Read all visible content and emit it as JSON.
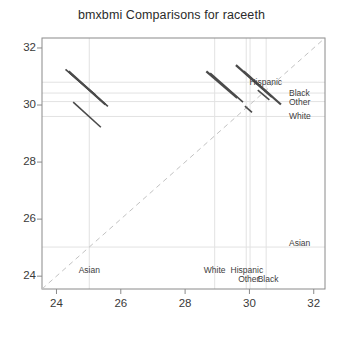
{
  "chart_data": {
    "type": "scatter",
    "title": "bmxbmi Comparisons for raceeth",
    "xlabel": "",
    "ylabel": "",
    "xlim": [
      23.55,
      32.35
    ],
    "ylim": [
      23.55,
      32.35
    ],
    "xticks": [
      "24",
      "26",
      "28",
      "30",
      "32"
    ],
    "xtick_values": [
      24,
      26,
      28,
      30,
      32
    ],
    "yticks": [
      "24",
      "26",
      "28",
      "30",
      "32"
    ],
    "ytick_values": [
      24,
      26,
      28,
      30,
      32
    ],
    "grid": true,
    "legend": "none",
    "reference_line": {
      "name": "identity-line",
      "style": "dashed",
      "color": "#c2c2c2",
      "from": [
        23.55,
        23.55
      ],
      "to": [
        32.35,
        32.35
      ]
    },
    "groups": [
      {
        "name": "Asian",
        "x": 25.02,
        "y": 25.02
      },
      {
        "name": "White",
        "x": 28.92,
        "y": 29.6
      },
      {
        "name": "Hispanic",
        "x": 29.9,
        "y": 30.8
      },
      {
        "name": "Other",
        "x": 30.02,
        "y": 30.12
      },
      {
        "name": "Black",
        "x": 30.52,
        "y": 30.42
      }
    ],
    "comparison_segments": [
      {
        "id": "seg-1",
        "x1": 24.28,
        "y1": 31.25,
        "x2": 25.22,
        "y2": 30.35,
        "weight": 1.6
      },
      {
        "id": "seg-2",
        "x1": 24.38,
        "y1": 31.18,
        "x2": 25.52,
        "y2": 30.02,
        "weight": 2.2
      },
      {
        "id": "seg-3",
        "x1": 24.42,
        "y1": 31.12,
        "x2": 25.6,
        "y2": 29.95,
        "weight": 1.6
      },
      {
        "id": "seg-4",
        "x1": 24.52,
        "y1": 30.1,
        "x2": 25.38,
        "y2": 29.22,
        "weight": 1.6
      },
      {
        "id": "seg-5",
        "x1": 28.66,
        "y1": 31.18,
        "x2": 29.62,
        "y2": 30.25,
        "weight": 2.2
      },
      {
        "id": "seg-6",
        "x1": 28.78,
        "y1": 31.12,
        "x2": 29.8,
        "y2": 30.1,
        "weight": 1.6
      },
      {
        "id": "seg-7",
        "x1": 29.58,
        "y1": 31.4,
        "x2": 30.7,
        "y2": 30.28,
        "weight": 2.2
      },
      {
        "id": "seg-8",
        "x1": 29.82,
        "y1": 31.18,
        "x2": 30.98,
        "y2": 30.02,
        "weight": 2.2
      },
      {
        "id": "seg-9",
        "x1": 30.26,
        "y1": 30.52,
        "x2": 30.62,
        "y2": 30.18,
        "weight": 1.6
      },
      {
        "id": "seg-10",
        "x1": 29.86,
        "y1": 29.96,
        "x2": 30.08,
        "y2": 29.74,
        "weight": 1.6
      }
    ],
    "axis_group_labels_bottom": [
      {
        "label": "Asian",
        "x": 25.02
      },
      {
        "label": "White",
        "x": 28.92
      },
      {
        "label": "Hispanic",
        "x": 29.92
      },
      {
        "label": "Other",
        "x": 29.98
      },
      {
        "label": "Black",
        "x": 30.58
      }
    ],
    "axis_group_labels_right": [
      {
        "label": "Hispanic",
        "y": 30.8
      },
      {
        "label": "Black",
        "y": 30.42
      },
      {
        "label": "Other",
        "y": 30.12
      },
      {
        "label": "White",
        "y": 29.6
      },
      {
        "label": "Asian",
        "y": 25.18
      }
    ],
    "colors": {
      "segment": "#4a4a4a",
      "reference": "#c4c4c4",
      "grid": "#e2e2e2",
      "axis": "#8a8a8a",
      "text": "#3a3a3a"
    }
  }
}
